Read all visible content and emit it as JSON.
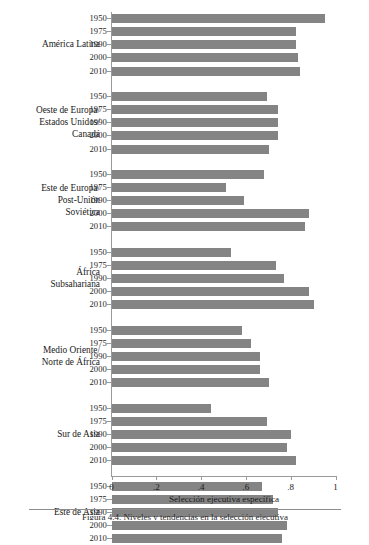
{
  "figure": {
    "xaxis_title": "Selección ejecutiva específica",
    "caption": "Figura 4.4. Niveles y tendencias en la selección ejecutiva"
  },
  "chart_data": {
    "type": "bar",
    "orientation": "horizontal",
    "title": "",
    "xlabel": "Selección ejecutiva específica",
    "ylabel": "",
    "xlim": [
      0,
      1.08
    ],
    "xticks": [
      0,
      0.2,
      0.4,
      0.6,
      0.8,
      1
    ],
    "xticklabels": [
      "0",
      ".2",
      ".4",
      ".6",
      ".8",
      "1"
    ],
    "grid": false,
    "legend": "none",
    "categories": [
      "1950",
      "1975",
      "1990",
      "2000",
      "2010"
    ],
    "groups": [
      {
        "name": "América Latina",
        "name_lines": [
          "América Latina"
        ],
        "values": [
          0.95,
          0.82,
          0.82,
          0.83,
          0.84
        ]
      },
      {
        "name": "Oeste de Europa/ Estados Unidos/ Canadá",
        "name_lines": [
          "Oeste de Europa/",
          "Estados Unidos/",
          "Canadá"
        ],
        "values": [
          0.69,
          0.74,
          0.74,
          0.74,
          0.7
        ]
      },
      {
        "name": "Este de Europa/ Post-Unión Soviética",
        "name_lines": [
          "Este de Europa/",
          "Post-Unión",
          "Soviética"
        ],
        "values": [
          0.68,
          0.51,
          0.59,
          0.88,
          0.86
        ]
      },
      {
        "name": "África Subsahariana",
        "name_lines": [
          "África",
          "Subsahariana"
        ],
        "values": [
          0.53,
          0.73,
          0.77,
          0.88,
          0.9
        ]
      },
      {
        "name": "Medio Oriente/ Norte de África",
        "name_lines": [
          "Medio Oriente/",
          "Norte de África"
        ],
        "values": [
          0.58,
          0.62,
          0.66,
          0.66,
          0.7
        ]
      },
      {
        "name": "Sur de Asia",
        "name_lines": [
          "Sur de Asia"
        ],
        "values": [
          0.44,
          0.69,
          0.8,
          0.78,
          0.82
        ]
      },
      {
        "name": "Este de Asia",
        "name_lines": [
          "Este de Asia"
        ],
        "values": [
          0.67,
          0.72,
          0.74,
          0.78,
          0.76
        ]
      }
    ]
  }
}
